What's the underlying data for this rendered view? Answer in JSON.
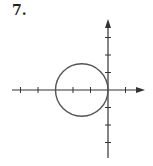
{
  "problem": {
    "number_label": "7."
  },
  "diagram": {
    "type": "circle-on-axes",
    "origin_px": [
      108,
      90
    ],
    "unit_px": 17.5,
    "x_ticks": [
      -5,
      -4,
      -3,
      -2,
      -1,
      1
    ],
    "y_ticks": [
      -3,
      -2,
      -1,
      1,
      2,
      3
    ],
    "circle": {
      "center": [
        -1.5,
        0
      ],
      "radius": 1.5
    },
    "colors": {
      "axis": "#333333",
      "circle": "#555555"
    }
  }
}
